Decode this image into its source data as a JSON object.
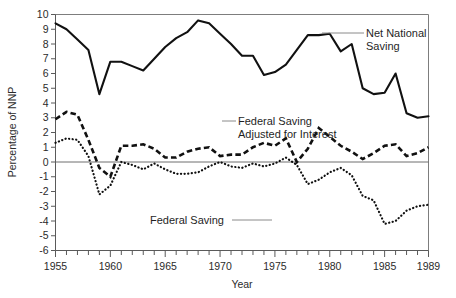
{
  "chart_data": {
    "type": "line",
    "title": "",
    "xlabel": "Year",
    "ylabel": "Percentage of NNP",
    "xlim": [
      1955,
      1989
    ],
    "ylim": [
      -6,
      10
    ],
    "xticks_major": [
      1955,
      1960,
      1965,
      1970,
      1975,
      1980,
      1985,
      1989
    ],
    "xticks_major_labels": [
      "1955",
      "1960",
      "1965",
      "1970",
      "1975",
      "1980",
      "1985",
      "1989"
    ],
    "yticks": [
      -6,
      -5,
      -4,
      -3,
      -2,
      -1,
      0,
      1,
      2,
      3,
      4,
      5,
      6,
      7,
      8,
      9,
      10
    ],
    "ytick_labels": [
      "-6",
      "-5",
      "-4",
      "-3",
      "-2",
      "-1",
      "0",
      "1",
      "2",
      "3",
      "4",
      "5",
      "6",
      "7",
      "8",
      "9",
      "10"
    ],
    "grid": false,
    "legend_position": "inline-annotations",
    "x": [
      1955,
      1956,
      1957,
      1958,
      1959,
      1960,
      1961,
      1962,
      1963,
      1964,
      1965,
      1966,
      1967,
      1968,
      1969,
      1970,
      1971,
      1972,
      1973,
      1974,
      1975,
      1976,
      1977,
      1978,
      1979,
      1980,
      1981,
      1982,
      1983,
      1984,
      1985,
      1986,
      1987,
      1988,
      1989
    ],
    "series": [
      {
        "name": "Net National Saving",
        "style": "solid",
        "values": [
          9.4,
          9.0,
          8.3,
          7.6,
          4.6,
          6.8,
          6.8,
          6.5,
          6.2,
          7.0,
          7.8,
          8.4,
          8.8,
          9.6,
          9.4,
          8.7,
          8.0,
          7.2,
          7.2,
          5.9,
          6.1,
          6.6,
          7.6,
          8.6,
          8.6,
          8.7,
          7.5,
          8.0,
          5.0,
          4.6,
          4.7,
          6.0,
          3.3,
          3.0,
          3.1
        ]
      },
      {
        "name": "Federal Saving Adjusted for Interest",
        "style": "dashed",
        "values": [
          2.9,
          3.4,
          3.2,
          1.5,
          -0.4,
          -1.0,
          1.1,
          1.1,
          1.2,
          0.9,
          0.3,
          0.3,
          0.7,
          0.9,
          1.0,
          0.4,
          0.5,
          0.5,
          1.0,
          1.3,
          1.1,
          1.6,
          0.0,
          0.9,
          2.3,
          1.7,
          1.1,
          0.7,
          0.2,
          0.6,
          1.1,
          1.2,
          0.4,
          0.6,
          1.0
        ]
      },
      {
        "name": "Federal Saving",
        "style": "dotted",
        "values": [
          1.3,
          1.6,
          1.5,
          0.4,
          -2.2,
          -1.6,
          0.0,
          -0.2,
          -0.5,
          -0.1,
          -0.5,
          -0.8,
          -0.8,
          -0.7,
          -0.3,
          0.0,
          -0.3,
          -0.4,
          -0.1,
          -0.3,
          -0.1,
          0.3,
          -0.2,
          -1.5,
          -1.2,
          -0.7,
          -0.4,
          -0.9,
          -2.3,
          -2.6,
          -4.2,
          -4.0,
          -3.3,
          -3.0,
          -2.9
        ]
      }
    ],
    "annotations": [
      {
        "id": "net-national-saving",
        "text_line1": "Net National",
        "text_line2": "Saving"
      },
      {
        "id": "federal-saving-adjusted",
        "text_line1": "Federal Saving",
        "text_line2": "Adjusted for Interest"
      },
      {
        "id": "federal-saving",
        "text_line1": "Federal Saving",
        "text_line2": ""
      }
    ]
  }
}
